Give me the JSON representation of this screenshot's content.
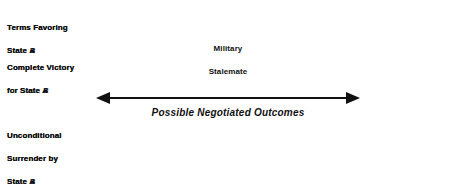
{
  "diagram": {
    "colors": {
      "outer_panel_fill": "#c9c9c9",
      "inner_panel_fill": "#e3e3e3",
      "center_panel_fill": "#ffffff",
      "border": "#1a1a1a",
      "text": "#111111"
    },
    "panels": {
      "left_outer": {
        "victory_line1": "Complete Victory",
        "victory_line2": "fcr State ",
        "victory_state": "A",
        "surrender_line1": "Unconditional",
        "surrender_line2": "Surrender by",
        "surrender_line3": "State ",
        "surrender_state": "B"
      },
      "left_inner": {
        "terms_line1": "Terms Favoring",
        "terms_line2": "State ",
        "terms_state": "A"
      },
      "center": {
        "line1": "Military",
        "line2": "Stalemate"
      },
      "right_inner": {
        "terms_line1": "Terms Favoring",
        "terms_line2": "State ",
        "terms_state": "B"
      },
      "right_outer": {
        "victory_line1": "Complete Victory",
        "victory_line2": "for State ",
        "victory_state": "B",
        "surrender_line1": "Unconditional",
        "surrender_line2": "Surrender by",
        "surrender_line3": "State ",
        "surrender_state": "A"
      }
    },
    "arrow": {
      "caption": "Possible Negotiated Outcomes",
      "style": "double-headed-horizontal"
    }
  }
}
